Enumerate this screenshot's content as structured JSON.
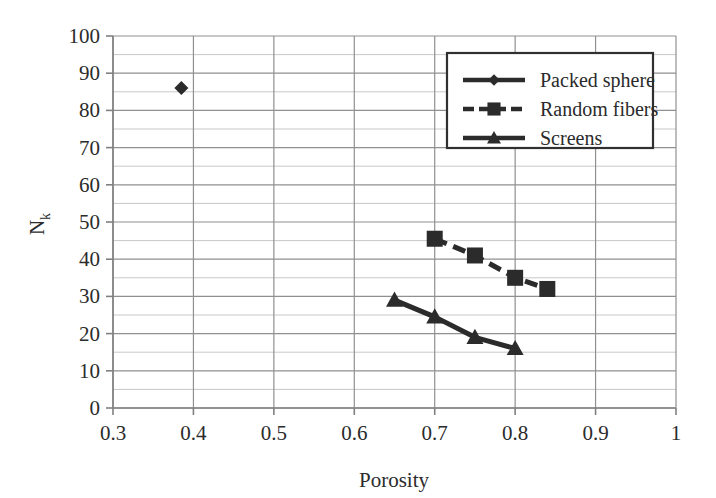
{
  "chart_data": {
    "type": "scatter",
    "title": "",
    "subtitle": "",
    "xlabel": "Porosity",
    "ylabel": "Nk",
    "ylabel_base": "N",
    "ylabel_sub": "k",
    "xlim": [
      0.3,
      1.0
    ],
    "ylim": [
      0,
      100
    ],
    "x_ticks": [
      "0.3",
      "0.4",
      "0.5",
      "0.6",
      "0.7",
      "0.8",
      "0.9",
      "1"
    ],
    "x_tick_values": [
      0.3,
      0.4,
      0.5,
      0.6,
      0.7,
      0.8,
      0.9,
      1.0
    ],
    "y_ticks": [
      "0",
      "10",
      "20",
      "30",
      "40",
      "50",
      "60",
      "70",
      "80",
      "90",
      "100"
    ],
    "y_tick_values": [
      0,
      10,
      20,
      30,
      40,
      50,
      60,
      70,
      80,
      90,
      100
    ],
    "y_minor_step": 5,
    "grid": "both-axes-major-plus-y-minor",
    "legend_position": "top-right-inside",
    "series": [
      {
        "name": "Packed sphere",
        "marker": "diamond",
        "line": "solid",
        "color": "#2b2b2b",
        "points": [
          {
            "x": 0.385,
            "y": 86
          }
        ]
      },
      {
        "name": "Random fibers",
        "marker": "square",
        "line": "dashed",
        "color": "#2b2b2b",
        "points": [
          {
            "x": 0.7,
            "y": 45.5
          },
          {
            "x": 0.75,
            "y": 41
          },
          {
            "x": 0.8,
            "y": 35
          },
          {
            "x": 0.84,
            "y": 32
          }
        ]
      },
      {
        "name": "Screens",
        "marker": "triangle",
        "line": "solid",
        "color": "#2b2b2b",
        "points": [
          {
            "x": 0.65,
            "y": 29
          },
          {
            "x": 0.7,
            "y": 24.5
          },
          {
            "x": 0.75,
            "y": 19
          },
          {
            "x": 0.8,
            "y": 16
          }
        ]
      }
    ],
    "colors": {
      "plot_border": "#808080",
      "major_grid": "#909090",
      "minor_grid": "#c8c8c8",
      "data": "#2b2b2b",
      "legend_border": "#303030",
      "background": "#ffffff"
    }
  },
  "legend": {
    "items": [
      {
        "label": "Packed sphere",
        "marker": "diamond"
      },
      {
        "label": "Random fibers",
        "marker": "square"
      },
      {
        "label": "Screens",
        "marker": "triangle"
      }
    ]
  },
  "axes": {
    "x_title": "Porosity",
    "y_title_base": "N",
    "y_title_sub": "k"
  }
}
